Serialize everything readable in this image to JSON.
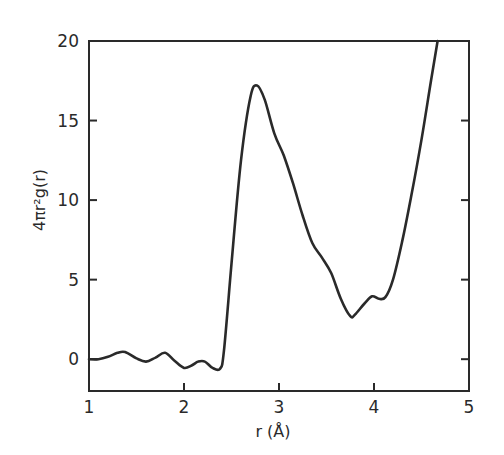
{
  "chart_data": {
    "type": "line",
    "title": "",
    "xlabel": "r (Å)",
    "ylabel": "4πr²g(r)",
    "xlim": [
      1,
      5
    ],
    "ylim": [
      -2,
      20
    ],
    "grid": false,
    "legend": null,
    "x_ticks": [
      1,
      2,
      3,
      4,
      5
    ],
    "x_tick_labels": [
      "1",
      "2",
      "3",
      "4",
      "5"
    ],
    "y_ticks": [
      0,
      5,
      10,
      15,
      20
    ],
    "y_tick_labels": [
      "0",
      "5",
      "10",
      "15",
      "20"
    ],
    "series": [
      {
        "name": "4πr²g(r)",
        "color": "#2a2a2a",
        "x": [
          1.0,
          1.1,
          1.2,
          1.3,
          1.38,
          1.5,
          1.6,
          1.7,
          1.8,
          1.9,
          2.0,
          2.08,
          2.15,
          2.22,
          2.3,
          2.38,
          2.42,
          2.5,
          2.6,
          2.7,
          2.77,
          2.85,
          2.95,
          3.05,
          3.15,
          3.25,
          3.35,
          3.45,
          3.55,
          3.65,
          3.75,
          3.8,
          3.9,
          3.98,
          4.05,
          4.12,
          4.2,
          4.3,
          4.4,
          4.5,
          4.6,
          4.67
        ],
        "y": [
          0.0,
          0.0,
          0.15,
          0.4,
          0.45,
          0.05,
          -0.15,
          0.1,
          0.4,
          -0.1,
          -0.55,
          -0.4,
          -0.15,
          -0.15,
          -0.55,
          -0.6,
          0.5,
          6.0,
          12.5,
          16.5,
          17.2,
          16.3,
          14.2,
          12.8,
          11.0,
          9.0,
          7.3,
          6.4,
          5.4,
          3.8,
          2.7,
          2.8,
          3.5,
          3.95,
          3.8,
          3.9,
          5.0,
          7.5,
          10.5,
          13.8,
          17.5,
          20.0
        ]
      }
    ]
  },
  "axes": {
    "x_title": "r (Å)",
    "y_title": "4πr²g(r)",
    "x_tick_labels": [
      "1",
      "2",
      "3",
      "4",
      "5"
    ],
    "y_tick_labels": [
      "0",
      "5",
      "10",
      "15",
      "20"
    ]
  }
}
